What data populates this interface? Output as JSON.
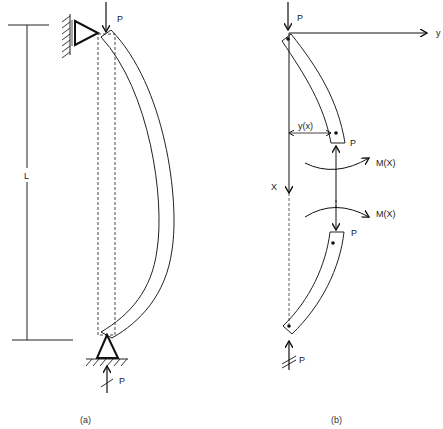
{
  "figure": {
    "panels": [
      {
        "id": "a",
        "caption": "(a)",
        "dimension_label": "L",
        "top_load_label": "P",
        "bottom_load_label": "P",
        "description": "Pin-ended column of length L buckled under axial load P; dashed outline shows undeformed position"
      },
      {
        "id": "b",
        "caption": "(b)",
        "axis_x_label": "X",
        "axis_y_label": "y",
        "deflection_label": "y(x)",
        "moment_label_upper": "M(X)",
        "moment_label_lower": "M(X)",
        "load_labels": [
          "P",
          "P",
          "P",
          "P"
        ],
        "description": "Free-body diagram of cut column segments with internal moment M(X)"
      }
    ]
  }
}
